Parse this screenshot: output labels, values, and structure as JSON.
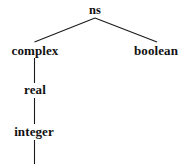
{
  "diagram": {
    "kind": "tree",
    "background_color": "#ffffff",
    "line_color": "#1a1a1a",
    "text_color": "#111111",
    "nodes": [
      {
        "id": "ns",
        "label": "ns",
        "x": 95,
        "y": 10,
        "level": 0
      },
      {
        "id": "complex",
        "label": "complex",
        "x": 35,
        "y": 50,
        "level": 1
      },
      {
        "id": "boolean",
        "label": "boolean",
        "x": 156,
        "y": 50,
        "level": 1
      },
      {
        "id": "real",
        "label": "real",
        "x": 35,
        "y": 89,
        "level": 2
      },
      {
        "id": "integer",
        "label": "integer",
        "x": 34,
        "y": 131,
        "level": 3
      }
    ],
    "edges": [
      {
        "id": "ns-complex",
        "from": "ns",
        "to": "complex",
        "x1": 95,
        "y1": 18,
        "x2": 34.5,
        "y2": 42
      },
      {
        "id": "ns-boolean",
        "from": "ns",
        "to": "boolean",
        "x1": 95,
        "y1": 18,
        "x2": 157,
        "y2": 42
      },
      {
        "id": "complex-real",
        "from": "complex",
        "to": "real",
        "x1": 34.5,
        "y1": 58,
        "x2": 34.5,
        "y2": 83
      },
      {
        "id": "real-integer",
        "from": "real",
        "to": "integer",
        "x1": 34.5,
        "y1": 98,
        "x2": 34.5,
        "y2": 124
      },
      {
        "id": "integer-below",
        "from": "integer",
        "to": null,
        "x1": 34.5,
        "y1": 140,
        "x2": 34.5,
        "y2": 164
      }
    ]
  }
}
